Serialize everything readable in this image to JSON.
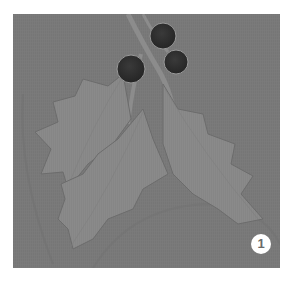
{
  "image": {
    "subject": "holly leaves with berries on textured fabric",
    "description": "Grayscale instructional photo: three holly leaves with three dark round berries on a gray fabric background",
    "colors": {
      "page_background": "#ffffff",
      "fabric_background": "#7a7a7a",
      "leaf": "#8a8a8a",
      "leaf_shadow": "#6e6e6e",
      "berry": "#2e2e2e",
      "badge_background": "#ffffff",
      "badge_text": "#6a6a6a"
    },
    "elements": {
      "leaves": 3,
      "berries": 3
    }
  },
  "step_badge": {
    "number": "1"
  }
}
